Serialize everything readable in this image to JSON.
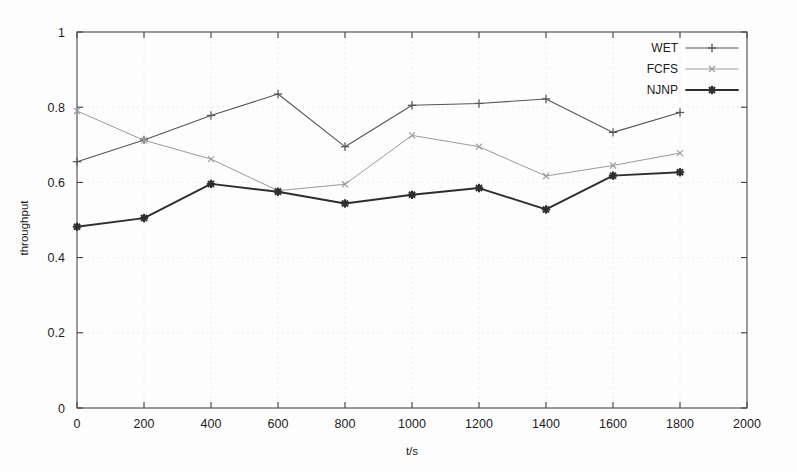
{
  "chart_data": {
    "type": "line",
    "title": "",
    "xlabel": "t/s",
    "ylabel": "throughput",
    "xlim": [
      0,
      2000
    ],
    "ylim": [
      0,
      1
    ],
    "grid": true,
    "legend_position": "top-right",
    "x": [
      0,
      200,
      400,
      600,
      800,
      1000,
      1200,
      1400,
      1600,
      1800
    ],
    "xticks": [
      "0",
      "200",
      "400",
      "600",
      "800",
      "1000",
      "1200",
      "1400",
      "1600",
      "1800",
      "2000"
    ],
    "xtick_values": [
      0,
      200,
      400,
      600,
      800,
      1000,
      1200,
      1400,
      1600,
      1800,
      2000
    ],
    "yticks": [
      "0",
      "0.2",
      "0.4",
      "0.6",
      "0.8",
      "1"
    ],
    "ytick_values": [
      0,
      0.2,
      0.4,
      0.6,
      0.8,
      1
    ],
    "series": [
      {
        "name": "WET",
        "marker": "plus",
        "color": "#555555",
        "width": 1.1,
        "values": [
          0.655,
          0.713,
          0.778,
          0.835,
          0.695,
          0.805,
          0.81,
          0.822,
          0.733,
          0.786
        ]
      },
      {
        "name": "FCFS",
        "marker": "cross",
        "color": "#9a9a9a",
        "width": 1.0,
        "values": [
          0.79,
          0.712,
          0.662,
          0.578,
          0.595,
          0.725,
          0.695,
          0.617,
          0.645,
          0.678
        ]
      },
      {
        "name": "NJNP",
        "marker": "star",
        "color": "#2e2e2e",
        "width": 1.9,
        "values": [
          0.482,
          0.505,
          0.596,
          0.575,
          0.544,
          0.567,
          0.585,
          0.528,
          0.618,
          0.627
        ]
      }
    ]
  },
  "legend": {
    "entries": [
      {
        "label": "WET"
      },
      {
        "label": "FCFS"
      },
      {
        "label": "NJNP"
      }
    ]
  },
  "axes": {
    "x_title": "t/s",
    "y_title": "throughput"
  }
}
